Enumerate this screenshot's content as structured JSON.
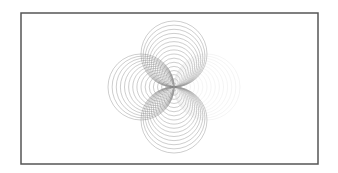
{
  "figure": {
    "frame": {
      "x": 21,
      "y": 13,
      "width": 297,
      "height": 151,
      "stroke": "#555555"
    },
    "tangent_point": {
      "x": 174,
      "y": 87
    },
    "rings_per_family": 16,
    "max_radius": 33,
    "families": [
      {
        "name": "top",
        "direction": "up",
        "color": "#7a7a7a",
        "opacity": 0.75
      },
      {
        "name": "left",
        "direction": "left",
        "color": "#7a7a7a",
        "opacity": 0.75
      },
      {
        "name": "bottom",
        "direction": "down",
        "color": "#7a7a7a",
        "opacity": 0.75
      },
      {
        "name": "right",
        "direction": "right",
        "color": "#bbbbbb",
        "opacity": 0.3
      }
    ]
  }
}
